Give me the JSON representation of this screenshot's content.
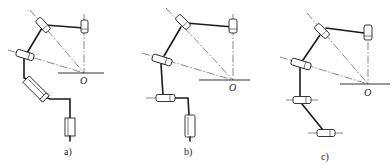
{
  "figure": {
    "panels": [
      {
        "id": "a",
        "label": "a)",
        "origin_label": "O"
      },
      {
        "id": "b",
        "label": "b)",
        "origin_label": "O"
      },
      {
        "id": "c",
        "label": "c)",
        "origin_label": "O"
      }
    ]
  },
  "colors": {
    "line": "#1a1a1a",
    "axis": "#555555",
    "background": "#ffffff"
  }
}
